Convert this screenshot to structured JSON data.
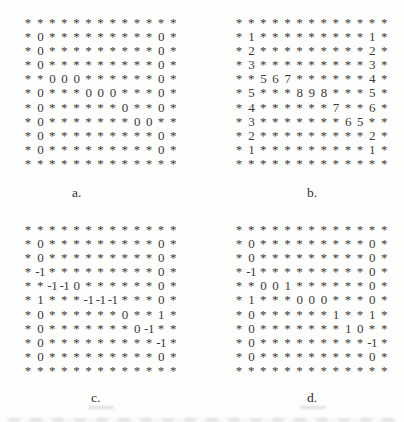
{
  "figure": {
    "ink_color": "#3a3a3a",
    "background_color": "#fdfdfc",
    "panels": [
      {
        "id": "a",
        "label": "a.",
        "rows": [
          [
            "*",
            "*",
            "*",
            "*",
            "*",
            "*",
            "*",
            "*",
            "*",
            "*",
            "*",
            "*",
            "*"
          ],
          [
            "*",
            "0",
            "*",
            "*",
            "*",
            "*",
            "*",
            "*",
            "*",
            "*",
            "*",
            "0",
            "*"
          ],
          [
            "*",
            "0",
            "*",
            "*",
            "*",
            "*",
            "*",
            "*",
            "*",
            "*",
            "*",
            "0",
            "*"
          ],
          [
            "*",
            "0",
            "*",
            "*",
            "*",
            "*",
            "*",
            "*",
            "*",
            "*",
            "*",
            "0",
            "*"
          ],
          [
            "*",
            "*",
            "0",
            "0",
            "0",
            "*",
            "*",
            "*",
            "*",
            "*",
            "*",
            "0",
            "*"
          ],
          [
            "*",
            "0",
            "*",
            "*",
            "*",
            "0",
            "0",
            "0",
            "*",
            "*",
            "*",
            "0",
            "*"
          ],
          [
            "*",
            "0",
            "*",
            "*",
            "*",
            "*",
            "*",
            "*",
            "0",
            "*",
            "*",
            "0",
            "*"
          ],
          [
            "*",
            "0",
            "*",
            "*",
            "*",
            "*",
            "*",
            "*",
            "*",
            "0",
            "0",
            "*",
            "*"
          ],
          [
            "*",
            "0",
            "*",
            "*",
            "*",
            "*",
            "*",
            "*",
            "*",
            "*",
            "*",
            "0",
            "*"
          ],
          [
            "*",
            "0",
            "*",
            "*",
            "*",
            "*",
            "*",
            "*",
            "*",
            "*",
            "*",
            "0",
            "*"
          ],
          [
            "*",
            "*",
            "*",
            "*",
            "*",
            "*",
            "*",
            "*",
            "*",
            "*",
            "*",
            "*",
            "*"
          ]
        ]
      },
      {
        "id": "b",
        "label": "b.",
        "rows": [
          [
            "*",
            "*",
            "*",
            "*",
            "*",
            "*",
            "*",
            "*",
            "*",
            "*",
            "*",
            "*",
            "*"
          ],
          [
            "*",
            "1",
            "*",
            "*",
            "*",
            "*",
            "*",
            "*",
            "*",
            "*",
            "*",
            "1",
            "*"
          ],
          [
            "*",
            "2",
            "*",
            "*",
            "*",
            "*",
            "*",
            "*",
            "*",
            "*",
            "*",
            "2",
            "*"
          ],
          [
            "*",
            "3",
            "*",
            "*",
            "*",
            "*",
            "*",
            "*",
            "*",
            "*",
            "*",
            "3",
            "*"
          ],
          [
            "*",
            "*",
            "5",
            "6",
            "7",
            "*",
            "*",
            "*",
            "*",
            "*",
            "*",
            "4",
            "*"
          ],
          [
            "*",
            "5",
            "*",
            "*",
            "*",
            "8",
            "9",
            "8",
            "*",
            "*",
            "*",
            "5",
            "*"
          ],
          [
            "*",
            "4",
            "*",
            "*",
            "*",
            "*",
            "*",
            "*",
            "7",
            "*",
            "*",
            "6",
            "*"
          ],
          [
            "*",
            "3",
            "*",
            "*",
            "*",
            "*",
            "*",
            "*",
            "*",
            "6",
            "5",
            "*",
            "*"
          ],
          [
            "*",
            "2",
            "*",
            "*",
            "*",
            "*",
            "*",
            "*",
            "*",
            "*",
            "*",
            "2",
            "*"
          ],
          [
            "*",
            "1",
            "*",
            "*",
            "*",
            "*",
            "*",
            "*",
            "*",
            "*",
            "*",
            "1",
            "*"
          ],
          [
            "*",
            "*",
            "*",
            "*",
            "*",
            "*",
            "*",
            "*",
            "*",
            "*",
            "*",
            "*",
            "*"
          ]
        ]
      },
      {
        "id": "c",
        "label": "c.",
        "rows": [
          [
            "*",
            "*",
            "*",
            "*",
            "*",
            "*",
            "*",
            "*",
            "*",
            "*",
            "*",
            "*",
            "*"
          ],
          [
            "*",
            "0",
            "*",
            "*",
            "*",
            "*",
            "*",
            "*",
            "*",
            "*",
            "*",
            "0",
            "*"
          ],
          [
            "*",
            "0",
            "*",
            "*",
            "*",
            "*",
            "*",
            "*",
            "*",
            "*",
            "*",
            "0",
            "*"
          ],
          [
            "*",
            "-1",
            "*",
            "*",
            "*",
            "*",
            "*",
            "*",
            "*",
            "*",
            "*",
            "0",
            "*"
          ],
          [
            "*",
            "*",
            "-1",
            "-1",
            "0",
            "*",
            "*",
            "*",
            "*",
            "*",
            "*",
            "0",
            "*"
          ],
          [
            "*",
            "1",
            "*",
            "*",
            "*",
            "-1",
            "-1",
            "-1",
            "*",
            "*",
            "*",
            "0",
            "*"
          ],
          [
            "*",
            "0",
            "*",
            "*",
            "*",
            "*",
            "*",
            "*",
            "0",
            "*",
            "*",
            "1",
            "*"
          ],
          [
            "*",
            "0",
            "*",
            "*",
            "*",
            "*",
            "*",
            "*",
            "*",
            "0",
            "-1",
            "*",
            "*"
          ],
          [
            "*",
            "0",
            "*",
            "*",
            "*",
            "*",
            "*",
            "*",
            "*",
            "*",
            "*",
            "-1",
            "*"
          ],
          [
            "*",
            "0",
            "*",
            "*",
            "*",
            "*",
            "*",
            "*",
            "*",
            "*",
            "*",
            "0",
            "*"
          ],
          [
            "*",
            "*",
            "*",
            "*",
            "*",
            "*",
            "*",
            "*",
            "*",
            "*",
            "*",
            "*",
            "*"
          ]
        ]
      },
      {
        "id": "d",
        "label": "d.",
        "rows": [
          [
            "*",
            "*",
            "*",
            "*",
            "*",
            "*",
            "*",
            "*",
            "*",
            "*",
            "*",
            "*",
            "*"
          ],
          [
            "*",
            "0",
            "*",
            "*",
            "*",
            "*",
            "*",
            "*",
            "*",
            "*",
            "*",
            "0",
            "*"
          ],
          [
            "*",
            "0",
            "*",
            "*",
            "*",
            "*",
            "*",
            "*",
            "*",
            "*",
            "*",
            "0",
            "*"
          ],
          [
            "*",
            "-1",
            "*",
            "*",
            "*",
            "*",
            "*",
            "*",
            "*",
            "*",
            "*",
            "0",
            "*"
          ],
          [
            "*",
            "*",
            "0",
            "0",
            "1",
            "*",
            "*",
            "*",
            "*",
            "*",
            "*",
            "0",
            "*"
          ],
          [
            "*",
            "1",
            "*",
            "*",
            "*",
            "0",
            "0",
            "0",
            "*",
            "*",
            "*",
            "0",
            "*"
          ],
          [
            "*",
            "0",
            "*",
            "*",
            "*",
            "*",
            "*",
            "*",
            "1",
            "*",
            "*",
            "1",
            "*"
          ],
          [
            "*",
            "0",
            "*",
            "*",
            "*",
            "*",
            "*",
            "*",
            "*",
            "1",
            "0",
            "*",
            "*"
          ],
          [
            "*",
            "0",
            "*",
            "*",
            "*",
            "*",
            "*",
            "*",
            "*",
            "*",
            "*",
            "-1",
            "*"
          ],
          [
            "*",
            "0",
            "*",
            "*",
            "*",
            "*",
            "*",
            "*",
            "*",
            "*",
            "*",
            "0",
            "*"
          ],
          [
            "*",
            "*",
            "*",
            "*",
            "*",
            "*",
            "*",
            "*",
            "*",
            "*",
            "*",
            "*",
            "*"
          ]
        ]
      }
    ]
  }
}
